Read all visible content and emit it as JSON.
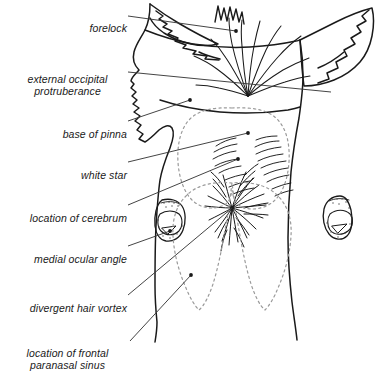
{
  "figure": {
    "background_color": "#ffffff",
    "ink_color": "#1a1a1a",
    "leader_color": "#3a3a3a",
    "dashed_color": "#9a9a9a"
  },
  "labels": [
    {
      "id": "forelock",
      "text": "forelock",
      "lines": 1,
      "x": 12,
      "y": 9,
      "w": 115,
      "align": "right",
      "anchor_x": 128,
      "anchor_y": 16,
      "tip_x": 236,
      "tip_y": 31,
      "dot": true
    },
    {
      "id": "external-occipital-protruberance",
      "text": "external occipital\nprotruberance",
      "lines": 2,
      "x": 8,
      "y": 60,
      "w": 119,
      "align": "center",
      "anchor_x": 128,
      "anchor_y": 72,
      "tip_x": 331,
      "tip_y": 92,
      "dot": false
    },
    {
      "id": "base-of-pinna",
      "text": "base of pinna",
      "lines": 1,
      "x": 12,
      "y": 115,
      "w": 115,
      "align": "right",
      "anchor_x": 128,
      "anchor_y": 121,
      "tip_x": 190,
      "tip_y": 100,
      "dot": true
    },
    {
      "id": "white-star",
      "text": "white star",
      "lines": 1,
      "x": 12,
      "y": 156,
      "w": 115,
      "align": "right",
      "anchor_x": 128,
      "anchor_y": 162,
      "tip_x": 248,
      "tip_y": 133,
      "dot": true
    },
    {
      "id": "location-of-cerebrum",
      "text": "location of cerebrum",
      "lines": 1,
      "x": 4,
      "y": 199,
      "w": 123,
      "align": "right",
      "anchor_x": 128,
      "anchor_y": 205,
      "tip_x": 238,
      "tip_y": 159,
      "dot": true
    },
    {
      "id": "medial-ocular-angle",
      "text": "medial ocular angle",
      "lines": 1,
      "x": 6,
      "y": 240,
      "w": 121,
      "align": "right",
      "anchor_x": 128,
      "anchor_y": 246,
      "tip_x": 170,
      "tip_y": 231,
      "dot": true
    },
    {
      "id": "divergent-hair-vortex",
      "text": "divergent hair vortex",
      "lines": 1,
      "x": 4,
      "y": 289,
      "w": 123,
      "align": "right",
      "anchor_x": 128,
      "anchor_y": 295,
      "tip_x": 232,
      "tip_y": 208,
      "dot": true
    },
    {
      "id": "location-of-frontal-paranasal-sinus",
      "text": "location of frontal\nparanasal sinus",
      "lines": 2,
      "x": 8,
      "y": 334,
      "w": 119,
      "align": "center",
      "anchor_x": 130,
      "anchor_y": 341,
      "tip_x": 191,
      "tip_y": 275,
      "dot": true
    }
  ],
  "regions": [
    {
      "id": "cerebrum-outline",
      "style": "dashed",
      "name": "location of cerebrum"
    },
    {
      "id": "frontal-paranasal-sinus-outline",
      "style": "dashed",
      "name": "location of frontal paranasal sinus"
    },
    {
      "id": "white-star-patch",
      "style": "hair-tufts",
      "name": "white star"
    },
    {
      "id": "divergent-hair-vortex-swirl",
      "style": "radiating-hairs",
      "name": "divergent hair vortex"
    },
    {
      "id": "forelock-tuft",
      "style": "fan-of-strands",
      "name": "forelock"
    }
  ],
  "features": [
    {
      "id": "left-ear",
      "name": "base of pinna (left)"
    },
    {
      "id": "right-ear",
      "name": "base of pinna (right)"
    },
    {
      "id": "left-eye",
      "name": "medial ocular angle (left)"
    },
    {
      "id": "right-eye",
      "name": "medial ocular angle (right)"
    },
    {
      "id": "head-outline",
      "name": "head and face outline"
    }
  ]
}
